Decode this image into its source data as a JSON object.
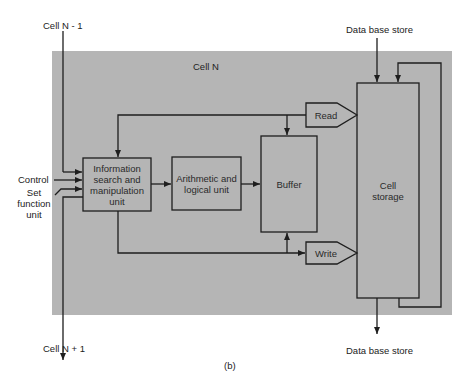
{
  "figure": {
    "caption": "(b)",
    "container_label": "Cell N",
    "colors": {
      "panel": "#b5b5b5",
      "line": "#1e1e1e",
      "background": "#ffffff"
    }
  },
  "external_labels": {
    "cell_prev": "Cell N - 1",
    "cell_next": "Cell N + 1",
    "control": "Control",
    "set_function_unit": [
      "Set",
      "function",
      "unit"
    ],
    "database_top": "Data base store",
    "database_bottom": "Data base store"
  },
  "blocks": {
    "info": [
      "Information",
      "search and",
      "manipulation",
      "unit"
    ],
    "alu": [
      "Arithmetic and",
      "logical unit"
    ],
    "buffer": "Buffer",
    "storage": [
      "Cell",
      "storage"
    ],
    "read": "Read",
    "write": "Write"
  }
}
